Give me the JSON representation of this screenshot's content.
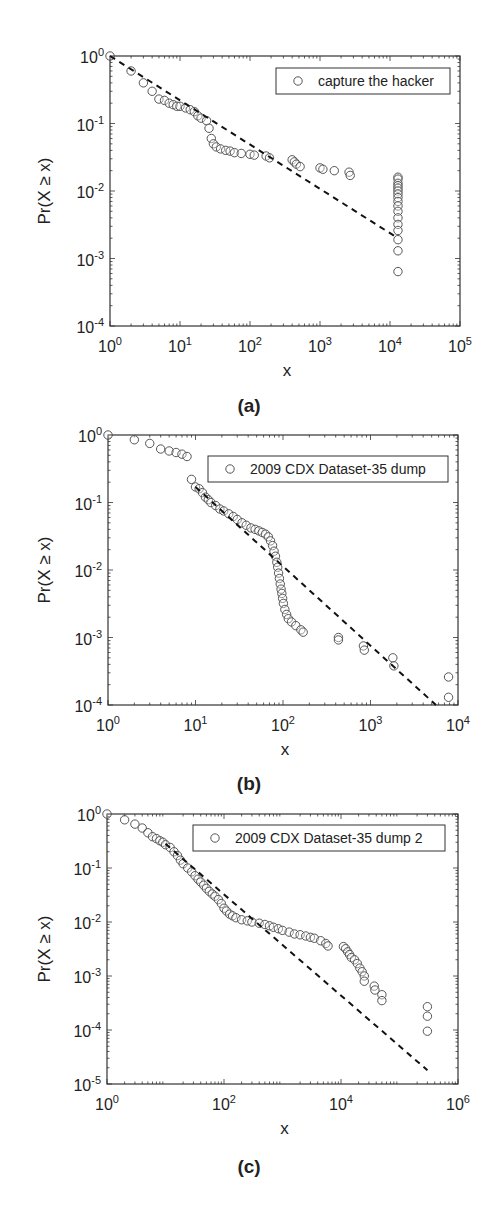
{
  "chart_data": [
    {
      "id": "a",
      "type": "scatter",
      "caption": "(a)",
      "title": "",
      "xlabel": "x",
      "ylabel": "Pr(X ≥ x)",
      "xscale": "log",
      "yscale": "log",
      "xlim": [
        1,
        100000
      ],
      "ylim": [
        0.0001,
        1
      ],
      "xticks": [
        "10^0",
        "10^1",
        "10^2",
        "10^3",
        "10^4",
        "10^5"
      ],
      "yticks": [
        "10^0",
        "10^-1",
        "10^-2",
        "10^-3",
        "10^-4"
      ],
      "grid": false,
      "legend": {
        "position": "upper right",
        "entries": [
          "capture the hacker"
        ]
      },
      "series": [
        {
          "name": "capture the hacker",
          "marker": "open-circle",
          "points": [
            [
              1,
              1.0
            ],
            [
              2,
              0.6
            ],
            [
              3,
              0.4
            ],
            [
              4,
              0.3
            ],
            [
              5,
              0.23
            ],
            [
              6,
              0.22
            ],
            [
              7,
              0.2
            ],
            [
              8,
              0.19
            ],
            [
              9,
              0.18
            ],
            [
              10,
              0.18
            ],
            [
              12,
              0.17
            ],
            [
              14,
              0.16
            ],
            [
              16,
              0.15
            ],
            [
              18,
              0.13
            ],
            [
              20,
              0.12
            ],
            [
              24,
              0.11
            ],
            [
              26,
              0.085
            ],
            [
              28,
              0.06
            ],
            [
              30,
              0.05
            ],
            [
              33,
              0.045
            ],
            [
              38,
              0.042
            ],
            [
              45,
              0.04
            ],
            [
              52,
              0.039
            ],
            [
              60,
              0.037
            ],
            [
              75,
              0.036
            ],
            [
              100,
              0.035
            ],
            [
              115,
              0.034
            ],
            [
              170,
              0.033
            ],
            [
              190,
              0.031
            ],
            [
              400,
              0.029
            ],
            [
              430,
              0.027
            ],
            [
              460,
              0.025
            ],
            [
              520,
              0.023
            ],
            [
              1000,
              0.022
            ],
            [
              1100,
              0.021
            ],
            [
              1600,
              0.02
            ],
            [
              2600,
              0.019
            ],
            [
              2700,
              0.017
            ],
            [
              13000,
              0.016
            ],
            [
              13000,
              0.015
            ],
            [
              13000,
              0.013
            ],
            [
              13000,
              0.012
            ],
            [
              13000,
              0.011
            ],
            [
              13000,
              0.01
            ],
            [
              13000,
              0.009
            ],
            [
              13000,
              0.008
            ],
            [
              13000,
              0.007
            ],
            [
              13000,
              0.006
            ],
            [
              13000,
              0.005
            ],
            [
              13000,
              0.004
            ],
            [
              13000,
              0.0032
            ],
            [
              13000,
              0.0026
            ],
            [
              13000,
              0.0019
            ],
            [
              13000,
              0.0013
            ],
            [
              13000,
              0.00064
            ]
          ]
        },
        {
          "name": "power-law fit",
          "style": "dashed",
          "points": [
            [
              1,
              1.0
            ],
            [
              13000,
              0.002
            ]
          ]
        }
      ]
    },
    {
      "id": "b",
      "type": "scatter",
      "caption": "(b)",
      "title": "",
      "xlabel": "x",
      "ylabel": "Pr(X ≥ x)",
      "xscale": "log",
      "yscale": "log",
      "xlim": [
        1,
        10000
      ],
      "ylim": [
        0.0001,
        1
      ],
      "xticks": [
        "10^0",
        "10^1",
        "10^2",
        "10^3",
        "10^4"
      ],
      "yticks": [
        "10^0",
        "10^-1",
        "10^-2",
        "10^-3",
        "10^-4"
      ],
      "grid": false,
      "legend": {
        "position": "upper right",
        "entries": [
          "2009 CDX Dataset-35 dump"
        ]
      },
      "series": [
        {
          "name": "2009 CDX Dataset-35 dump",
          "marker": "open-circle",
          "points": [
            [
              1,
              1.0
            ],
            [
              2,
              0.85
            ],
            [
              3,
              0.75
            ],
            [
              4,
              0.62
            ],
            [
              5,
              0.58
            ],
            [
              6,
              0.55
            ],
            [
              7,
              0.52
            ],
            [
              8,
              0.48
            ],
            [
              9,
              0.22
            ],
            [
              10,
              0.17
            ],
            [
              11,
              0.16
            ],
            [
              12,
              0.14
            ],
            [
              13,
              0.12
            ],
            [
              14,
              0.11
            ],
            [
              15,
              0.1
            ],
            [
              17,
              0.09
            ],
            [
              19,
              0.08
            ],
            [
              21,
              0.075
            ],
            [
              24,
              0.068
            ],
            [
              27,
              0.062
            ],
            [
              30,
              0.056
            ],
            [
              34,
              0.05
            ],
            [
              38,
              0.046
            ],
            [
              43,
              0.042
            ],
            [
              48,
              0.04
            ],
            [
              53,
              0.038
            ],
            [
              58,
              0.036
            ],
            [
              63,
              0.034
            ],
            [
              68,
              0.031
            ],
            [
              72,
              0.027
            ],
            [
              76,
              0.023
            ],
            [
              79,
              0.019
            ],
            [
              82,
              0.016
            ],
            [
              85,
              0.013
            ],
            [
              87,
              0.011
            ],
            [
              89,
              0.009
            ],
            [
              91,
              0.0075
            ],
            [
              93,
              0.0062
            ],
            [
              95,
              0.0052
            ],
            [
              97,
              0.0045
            ],
            [
              99,
              0.0038
            ],
            [
              101,
              0.0032
            ],
            [
              105,
              0.0026
            ],
            [
              110,
              0.0022
            ],
            [
              115,
              0.0019
            ],
            [
              125,
              0.0017
            ],
            [
              140,
              0.0015
            ],
            [
              160,
              0.0013
            ],
            [
              170,
              0.0012
            ],
            [
              430,
              0.001
            ],
            [
              430,
              0.00092
            ],
            [
              830,
              0.00075
            ],
            [
              850,
              0.00065
            ],
            [
              1800,
              0.0005
            ],
            [
              1850,
              0.00038
            ],
            [
              7800,
              0.00026
            ],
            [
              7800,
              0.00013
            ]
          ]
        },
        {
          "name": "power-law fit",
          "style": "dashed",
          "points": [
            [
              10,
              0.17
            ],
            [
              5600,
              0.0001
            ]
          ]
        }
      ]
    },
    {
      "id": "c",
      "type": "scatter",
      "caption": "(c)",
      "title": "",
      "xlabel": "x",
      "ylabel": "Pr(X ≥ x)",
      "xscale": "log",
      "yscale": "log",
      "xlim": [
        1,
        1000000
      ],
      "ylim": [
        1e-05,
        1
      ],
      "xticks": [
        "10^0",
        "10^2",
        "10^4",
        "10^6"
      ],
      "yticks": [
        "10^0",
        "10^-1",
        "10^-2",
        "10^-3",
        "10^-4",
        "10^-5"
      ],
      "grid": false,
      "legend": {
        "position": "upper right",
        "entries": [
          "2009 CDX Dataset-35 dump 2"
        ]
      },
      "series": [
        {
          "name": "2009 CDX Dataset-35 dump 2",
          "marker": "open-circle",
          "points": [
            [
              1,
              1.0
            ],
            [
              2,
              0.78
            ],
            [
              3,
              0.65
            ],
            [
              4,
              0.55
            ],
            [
              5,
              0.45
            ],
            [
              6,
              0.38
            ],
            [
              7,
              0.35
            ],
            [
              8,
              0.32
            ],
            [
              9,
              0.3
            ],
            [
              10,
              0.27
            ],
            [
              12,
              0.24
            ],
            [
              14,
              0.2
            ],
            [
              16,
              0.17
            ],
            [
              18,
              0.14
            ],
            [
              20,
              0.12
            ],
            [
              24,
              0.1
            ],
            [
              28,
              0.085
            ],
            [
              32,
              0.072
            ],
            [
              36,
              0.062
            ],
            [
              40,
              0.055
            ],
            [
              45,
              0.048
            ],
            [
              50,
              0.042
            ],
            [
              56,
              0.037
            ],
            [
              63,
              0.033
            ],
            [
              70,
              0.03
            ],
            [
              80,
              0.026
            ],
            [
              90,
              0.022
            ],
            [
              100,
              0.018
            ],
            [
              110,
              0.016
            ],
            [
              125,
              0.014
            ],
            [
              140,
              0.013
            ],
            [
              160,
              0.012
            ],
            [
              200,
              0.011
            ],
            [
              250,
              0.0105
            ],
            [
              300,
              0.01
            ],
            [
              400,
              0.0095
            ],
            [
              500,
              0.009
            ],
            [
              600,
              0.0085
            ],
            [
              700,
              0.008
            ],
            [
              850,
              0.0075
            ],
            [
              1000,
              0.007
            ],
            [
              1300,
              0.0065
            ],
            [
              1600,
              0.006
            ],
            [
              2000,
              0.0058
            ],
            [
              2500,
              0.0055
            ],
            [
              3000,
              0.0052
            ],
            [
              3500,
              0.005
            ],
            [
              4500,
              0.0045
            ],
            [
              5500,
              0.004
            ],
            [
              6000,
              0.0036
            ],
            [
              11000,
              0.0035
            ],
            [
              12000,
              0.0032
            ],
            [
              13000,
              0.0028
            ],
            [
              14000,
              0.0025
            ],
            [
              15000,
              0.0022
            ],
            [
              17000,
              0.002
            ],
            [
              19000,
              0.0017
            ],
            [
              21000,
              0.0014
            ],
            [
              23000,
              0.0012
            ],
            [
              25000,
              0.001
            ],
            [
              25000,
              0.0008
            ],
            [
              37000,
              0.00065
            ],
            [
              38000,
              0.00055
            ],
            [
              50000,
              0.00045
            ],
            [
              50000,
              0.00035
            ],
            [
              300000,
              0.00027
            ],
            [
              300000,
              0.00018
            ],
            [
              300000,
              9.5e-05
            ]
          ]
        },
        {
          "name": "power-law fit",
          "style": "dashed",
          "points": [
            [
              10,
              0.28
            ],
            [
              300000,
              1.8e-05
            ]
          ]
        }
      ]
    }
  ],
  "figures": [
    {
      "caption": "(a)",
      "legend_label": "capture the hacker",
      "xlabel": "x",
      "ylabel": "Pr(X ≥ x)"
    },
    {
      "caption": "(b)",
      "legend_label": "2009 CDX Dataset-35 dump",
      "xlabel": "x",
      "ylabel": "Pr(X ≥ x)"
    },
    {
      "caption": "(c)",
      "legend_label": "2009 CDX Dataset-35 dump 2",
      "xlabel": "x",
      "ylabel": "Pr(X ≥ x)"
    }
  ],
  "colors": {
    "marker_stroke": "#555555",
    "fit_line": "#111111",
    "axis": "#333333",
    "text": "#222222"
  }
}
